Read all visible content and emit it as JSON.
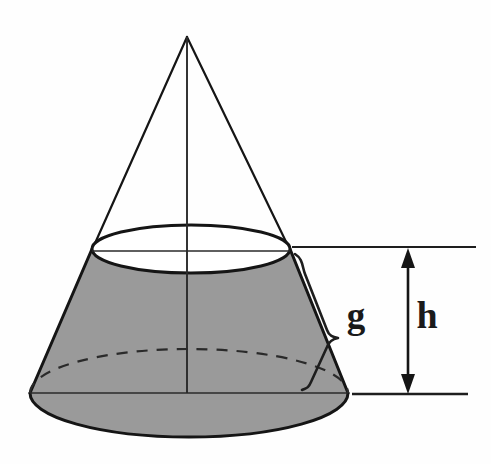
{
  "figure": {
    "background_color": "#fefefe"
  },
  "colors": {
    "outline": "#151515",
    "frustum_fill": "#9a9a9a",
    "thin_line": "#2a2a2a",
    "label": "#1a1a1a",
    "dashed": "#2a2a2a"
  },
  "labels": {
    "slant_height": "g",
    "height": "h"
  },
  "geometry": {
    "apex": {
      "x": 187,
      "y": 37
    },
    "axis_bottom": {
      "x": 187,
      "y": 393
    },
    "top_circle": {
      "cx": 191,
      "cy": 249,
      "rx": 99,
      "ry": 24
    },
    "bottom_circle": {
      "cx": 189,
      "cy": 393,
      "rx": 159,
      "ry": 44
    },
    "top_reference_line": {
      "x1": 292,
      "x2": 476,
      "y": 247
    },
    "bottom_reference_line": {
      "x1": 352,
      "x2": 468,
      "y": 394
    },
    "height_arrow": {
      "x": 408,
      "y_top": 252,
      "y_bottom": 390
    },
    "slant_brace": {
      "x1": 294,
      "y1": 256,
      "x2": 334,
      "y2": 386
    }
  },
  "annotations": {
    "slant_label_pos": {
      "x": 356,
      "y": 322
    },
    "height_label_pos": {
      "x": 427,
      "y": 325
    }
  }
}
